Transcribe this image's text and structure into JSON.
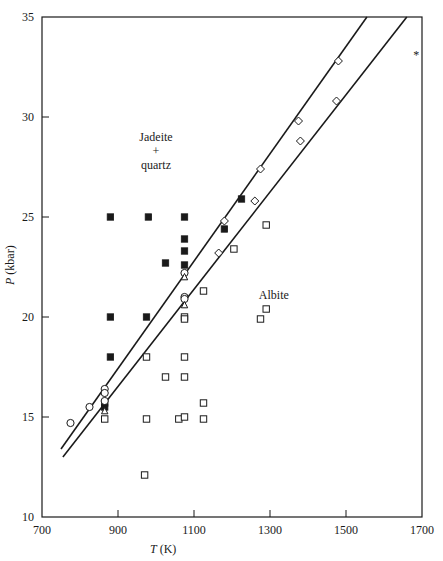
{
  "chart_data": {
    "type": "scatter",
    "title": "",
    "xlabel": "T (K)",
    "xlabel_italic": "T",
    "xlabel_unit": "(K)",
    "ylabel": "P (kbar)",
    "ylabel_italic": "P",
    "ylabel_unit": "(kbar)",
    "xlim": [
      700,
      1700
    ],
    "ylim": [
      10,
      35
    ],
    "xticks": [
      700,
      900,
      1100,
      1300,
      1500,
      1700
    ],
    "yticks": [
      10,
      15,
      20,
      25,
      30,
      35
    ],
    "grid": false,
    "annotations": [
      {
        "text": "Jadeite",
        "x": 1000,
        "y": 28.8
      },
      {
        "text": "+",
        "x": 1000,
        "y": 28.1
      },
      {
        "text": "quartz",
        "x": 1000,
        "y": 27.4
      },
      {
        "text": "Albite",
        "x": 1310,
        "y": 20.9
      },
      {
        "text": "*",
        "x": 1685,
        "y": 32.9
      }
    ],
    "lines": [
      {
        "name": "boundary-1",
        "points": [
          [
            750,
            13.4
          ],
          [
            1555,
            35.0
          ]
        ]
      },
      {
        "name": "boundary-2",
        "points": [
          [
            755,
            13.0
          ],
          [
            1660,
            35.0
          ]
        ]
      }
    ],
    "series": [
      {
        "name": "Jadeite + quartz (filled squares)",
        "marker": "filled-square",
        "points": [
          [
            880,
            25.0
          ],
          [
            980,
            25.0
          ],
          [
            1075,
            25.0
          ],
          [
            1075,
            23.9
          ],
          [
            1075,
            23.3
          ],
          [
            1025,
            22.7
          ],
          [
            1075,
            22.6
          ],
          [
            1180,
            24.4
          ],
          [
            1225,
            25.9
          ],
          [
            880,
            20.0
          ],
          [
            975,
            20.0
          ],
          [
            880,
            18.0
          ],
          [
            865,
            15.5
          ],
          [
            865,
            15.7
          ]
        ]
      },
      {
        "name": "Albite (open squares)",
        "marker": "open-square",
        "points": [
          [
            975,
            18.0
          ],
          [
            1075,
            18.0
          ],
          [
            1025,
            17.0
          ],
          [
            1075,
            17.0
          ],
          [
            1075,
            20.0
          ],
          [
            1075,
            19.9
          ],
          [
            1125,
            21.3
          ],
          [
            1205,
            23.4
          ],
          [
            1290,
            24.6
          ],
          [
            1290,
            20.4
          ],
          [
            1275,
            19.9
          ],
          [
            865,
            14.9
          ],
          [
            975,
            14.9
          ],
          [
            1060,
            14.9
          ],
          [
            1075,
            15.0
          ],
          [
            1125,
            14.9
          ],
          [
            1125,
            15.7
          ],
          [
            970,
            12.1
          ]
        ]
      },
      {
        "name": "Open circles",
        "marker": "open-circle",
        "points": [
          [
            775,
            14.7
          ],
          [
            825,
            15.5
          ],
          [
            865,
            16.4
          ],
          [
            865,
            16.2
          ],
          [
            865,
            15.8
          ],
          [
            1075,
            22.2
          ],
          [
            1075,
            21.0
          ],
          [
            1075,
            20.9
          ]
        ]
      },
      {
        "name": "Open diamonds (on boundaries)",
        "marker": "open-diamond",
        "points": [
          [
            1180,
            24.8
          ],
          [
            1275,
            27.4
          ],
          [
            1375,
            29.8
          ],
          [
            1480,
            32.8
          ],
          [
            1165,
            23.2
          ],
          [
            1260,
            25.8
          ],
          [
            1380,
            28.8
          ],
          [
            1475,
            30.8
          ]
        ]
      },
      {
        "name": "Open triangles",
        "marker": "open-triangle",
        "points": [
          [
            1075,
            22.0
          ],
          [
            1075,
            20.6
          ],
          [
            865,
            15.3
          ]
        ]
      }
    ]
  },
  "plot_area": {
    "left": 42,
    "right": 422,
    "top": 17,
    "bottom": 517
  }
}
